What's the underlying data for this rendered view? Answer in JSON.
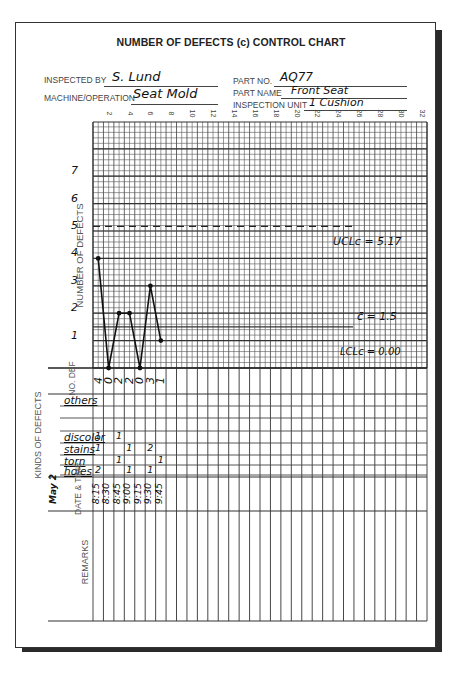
{
  "form": {
    "title": "NUMBER OF DEFECTS (c) CONTROL CHART",
    "inspected_by_label": "INSPECTED BY",
    "inspected_by_value": "S. Lund",
    "machine_label": "MACHINE/OPERATION",
    "machine_value": "Seat Mold",
    "part_no_label": "PART NO.",
    "part_no_value": "AQ77",
    "part_name_label": "PART NAME",
    "part_name_value": "Front Seat",
    "inspection_unit_label": "INSPECTION UNIT",
    "inspection_unit_value": "1 Cushion"
  },
  "axis": {
    "y_label": "NUMBER OF DEFECTS",
    "y_ticks": [
      "1",
      "2",
      "3",
      "4",
      "5",
      "6",
      "7"
    ],
    "x_ticks": [
      "2",
      "4",
      "6",
      "8",
      "10",
      "12",
      "14",
      "16",
      "18",
      "20",
      "22",
      "24",
      "26",
      "28",
      "30",
      "32"
    ]
  },
  "limits": {
    "ucl_label": "UCLc = 5.17",
    "cl_label": "c̄ = 1.5",
    "lcl_label": "LCLc = 0.00"
  },
  "table": {
    "no_def_label": "NO. DEF",
    "kinds_label": "KINDS OF DEFECTS",
    "date_time_label": "DATE & TIME",
    "date_value": "May 2",
    "remarks_label": "REMARKS",
    "defect_kinds": [
      "others",
      "",
      "",
      "discolor",
      "stains",
      "torn",
      "holes"
    ],
    "no_def": [
      "4",
      "0",
      "2",
      "2",
      "0",
      "3",
      "1"
    ],
    "times": [
      "8:15",
      "8:30",
      "8:45",
      "9:00",
      "9:15",
      "9:30",
      "9:45"
    ],
    "tallies": {
      "discolor": [
        "1",
        "",
        "1",
        "",
        "",
        "",
        ""
      ],
      "stains": [
        "1",
        "",
        "",
        "1",
        "",
        "2",
        ""
      ],
      "torn": [
        "",
        "",
        "1",
        "",
        "",
        "",
        "1"
      ],
      "holes": [
        "2",
        "",
        "",
        "1",
        "",
        "1",
        ""
      ]
    }
  },
  "chart_data": {
    "type": "line",
    "title": "NUMBER OF DEFECTS (c) CONTROL CHART",
    "xlabel": "Subgroup (Date & Time, May 2)",
    "ylabel": "NUMBER OF DEFECTS",
    "x": [
      "8:15",
      "8:30",
      "8:45",
      "9:00",
      "9:15",
      "9:30",
      "9:45"
    ],
    "series": [
      {
        "name": "Number of defects (c)",
        "values": [
          4,
          0,
          2,
          2,
          0,
          3,
          1
        ]
      }
    ],
    "control_limits": {
      "UCL": 5.17,
      "CL": 1.5,
      "LCL": 0.0
    },
    "ylim": [
      0,
      8
    ],
    "xlim": [
      1,
      32
    ],
    "grid": true
  }
}
